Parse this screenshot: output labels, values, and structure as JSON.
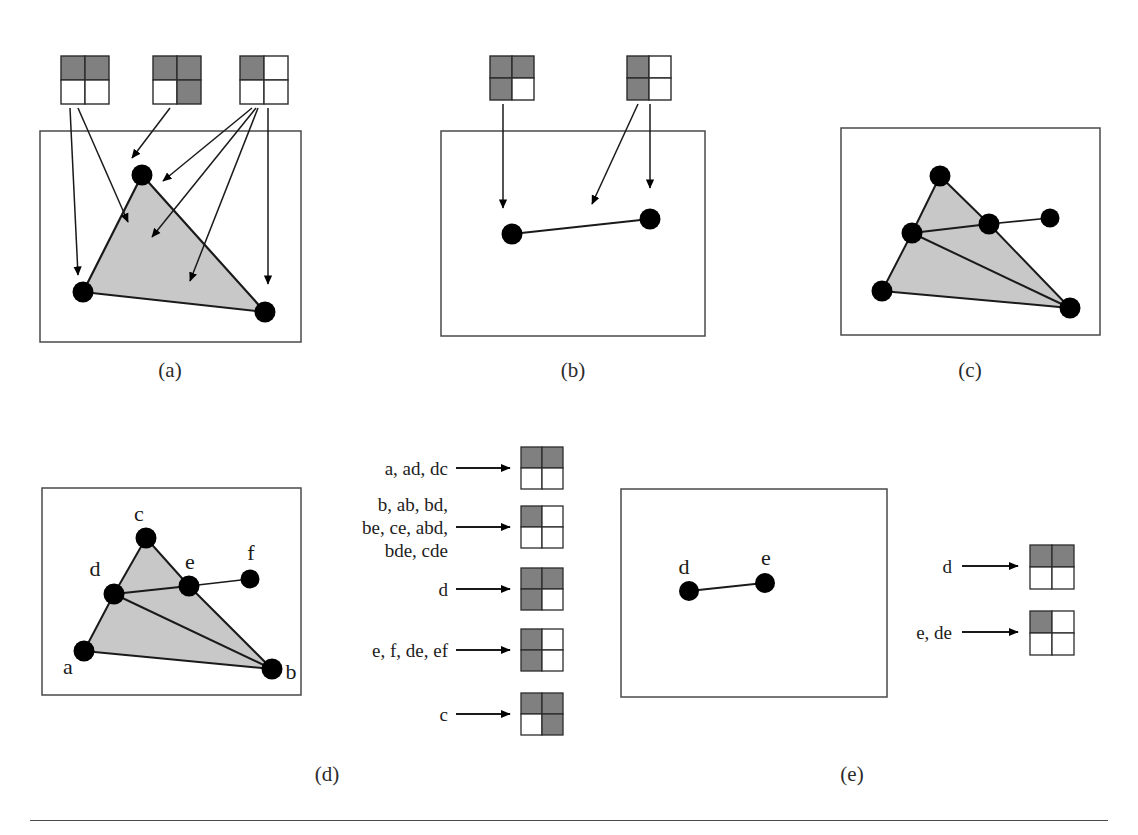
{
  "figure": {
    "background_color": "#ffffff",
    "ink_color": "#1a1a1a",
    "icon_shade_color": "#808080",
    "icon_empty_color": "#ffffff",
    "simplex_fill_color": "#c8c8c8",
    "vertex_color": "#000000",
    "rule_color": "#4a4a4a"
  },
  "captions": {
    "a": "(a)",
    "b": "(b)",
    "c": "(c)",
    "d": "(d)",
    "e": "(e)"
  },
  "icon_legend": {
    "description": "Each icon is a 2x2 grid of quadrants; shaded quadrants encode membership.",
    "quadrant_order": [
      "top-left",
      "top-right",
      "bottom-left",
      "bottom-right"
    ]
  },
  "panel_a": {
    "name": "panel-a",
    "icons": [
      {
        "id": "a-icon-1",
        "shaded": [
          "top-left",
          "top-right"
        ]
      },
      {
        "id": "a-icon-2",
        "shaded": [
          "top-left",
          "top-right",
          "bottom-right"
        ]
      },
      {
        "id": "a-icon-3",
        "shaded": [
          "top-left"
        ]
      }
    ],
    "vertices": [
      {
        "id": "c",
        "x": 142,
        "y": 175
      },
      {
        "id": "a",
        "x": 83,
        "y": 292
      },
      {
        "id": "b",
        "x": 265,
        "y": 312
      }
    ],
    "filled_triangle": [
      "c",
      "a",
      "b"
    ],
    "arrow_count": 6
  },
  "panel_b": {
    "name": "panel-b",
    "icons": [
      {
        "id": "b-icon-1",
        "shaded": [
          "top-left",
          "top-right",
          "bottom-left"
        ]
      },
      {
        "id": "b-icon-2",
        "shaded": [
          "top-left",
          "bottom-left"
        ]
      }
    ],
    "vertices": [
      {
        "id": "d",
        "x": 512,
        "y": 234
      },
      {
        "id": "e",
        "x": 650,
        "y": 219
      }
    ],
    "edges": [
      [
        "d",
        "e"
      ]
    ],
    "arrow_count": 3
  },
  "panel_c": {
    "name": "panel-c",
    "vertices": [
      {
        "id": "c",
        "x": 940,
        "y": 176
      },
      {
        "id": "d",
        "x": 912,
        "y": 233
      },
      {
        "id": "e",
        "x": 989,
        "y": 224
      },
      {
        "id": "f",
        "x": 1050,
        "y": 218
      },
      {
        "id": "a",
        "x": 882,
        "y": 291
      },
      {
        "id": "b",
        "x": 1070,
        "y": 308
      }
    ],
    "filled_triangles": [
      [
        "c",
        "d",
        "e"
      ],
      [
        "d",
        "a",
        "b"
      ],
      [
        "d",
        "e",
        "b"
      ]
    ],
    "edges": [
      [
        "e",
        "f"
      ],
      [
        "d",
        "e"
      ],
      [
        "d",
        "b"
      ],
      [
        "a",
        "b"
      ],
      [
        "c",
        "d"
      ],
      [
        "c",
        "e"
      ],
      [
        "a",
        "d"
      ],
      [
        "e",
        "b"
      ]
    ]
  },
  "panel_d": {
    "name": "panel-d",
    "vertices": [
      {
        "id": "c",
        "label": "c",
        "x": 146,
        "y": 538,
        "label_x": 146,
        "label_y": 514
      },
      {
        "id": "d",
        "label": "d",
        "x": 114,
        "y": 594,
        "label_x": 99,
        "label_y": 571
      },
      {
        "id": "e",
        "label": "e",
        "x": 189,
        "y": 586,
        "label_x": 192,
        "label_y": 562
      },
      {
        "id": "f",
        "label": "f",
        "x": 250,
        "y": 579,
        "label_x": 253,
        "label_y": 552
      },
      {
        "id": "a",
        "label": "a",
        "x": 84,
        "y": 651,
        "label_x": 69,
        "label_y": 669
      },
      {
        "id": "b",
        "label": "b",
        "x": 272,
        "y": 669,
        "label_x": 288,
        "label_y": 671
      }
    ],
    "filled_triangles": [
      [
        "c",
        "d",
        "e"
      ],
      [
        "d",
        "a",
        "b"
      ],
      [
        "d",
        "e",
        "b"
      ]
    ],
    "edges": [
      [
        "e",
        "f"
      ],
      [
        "d",
        "e"
      ],
      [
        "d",
        "b"
      ],
      [
        "a",
        "b"
      ],
      [
        "c",
        "d"
      ],
      [
        "c",
        "e"
      ],
      [
        "a",
        "d"
      ],
      [
        "e",
        "b"
      ]
    ],
    "mappings": [
      {
        "label": [
          "a, ad, dc"
        ],
        "shaded": [
          "top-left",
          "top-right"
        ]
      },
      {
        "label": [
          "b, ab, bd,",
          "be, ce, abd,",
          "bde, cde"
        ],
        "shaded": [
          "top-left"
        ]
      },
      {
        "label": [
          "d"
        ],
        "shaded": [
          "top-left",
          "top-right",
          "bottom-left"
        ]
      },
      {
        "label": [
          "e, f, de, ef"
        ],
        "shaded": [
          "top-left",
          "bottom-left"
        ]
      },
      {
        "label": [
          "c"
        ],
        "shaded": [
          "top-left",
          "top-right",
          "bottom-right"
        ]
      }
    ]
  },
  "panel_e": {
    "name": "panel-e",
    "vertices": [
      {
        "id": "d",
        "label": "d",
        "x": 689,
        "y": 591,
        "label_x": 685,
        "label_y": 566
      },
      {
        "id": "e",
        "label": "e",
        "x": 765,
        "y": 583,
        "label_x": 766,
        "label_y": 556
      }
    ],
    "edges": [
      [
        "d",
        "e"
      ]
    ],
    "mappings": [
      {
        "label": [
          "d"
        ],
        "shaded": [
          "top-left",
          "top-right"
        ]
      },
      {
        "label": [
          "e, de"
        ],
        "shaded": [
          "top-left"
        ]
      }
    ]
  }
}
